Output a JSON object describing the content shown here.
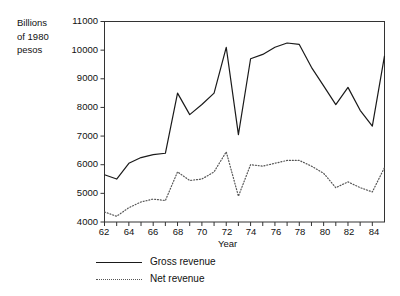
{
  "axis": {
    "y_title": "Billions\nof 1980\npesos",
    "x_title": "Year",
    "y_ticks": [
      "11000",
      "10000",
      "9000",
      "8000",
      "7000",
      "6000",
      "5000",
      "4000"
    ],
    "x_ticks": [
      "62",
      "64",
      "66",
      "68",
      "70",
      "72",
      "74",
      "76",
      "78",
      "80",
      "82",
      "84"
    ]
  },
  "legend": {
    "items": [
      {
        "label": "Gross revenue",
        "style": "solid",
        "color": "#1a1a1a"
      },
      {
        "label": "Net revenue",
        "style": "dotted",
        "color": "#555555"
      }
    ]
  },
  "chart_data": {
    "type": "line",
    "title": "",
    "xlabel": "Year",
    "ylabel": "Billions of 1980 pesos",
    "xlim": [
      62,
      85
    ],
    "ylim": [
      4000,
      11000
    ],
    "grid": false,
    "legend_position": "below-left",
    "x": [
      62,
      63,
      64,
      65,
      66,
      67,
      68,
      69,
      70,
      71,
      72,
      73,
      74,
      75,
      76,
      77,
      78,
      79,
      80,
      81,
      82,
      83,
      84,
      85
    ],
    "series": [
      {
        "name": "Gross revenue",
        "style": "solid",
        "color": "#1a1a1a",
        "values": [
          5650,
          5500,
          6050,
          6250,
          6350,
          6400,
          8500,
          7750,
          8100,
          8500,
          10100,
          7050,
          9700,
          9850,
          10100,
          10250,
          10200,
          9400,
          8750,
          8100,
          8700,
          7900,
          7350,
          9800
        ]
      },
      {
        "name": "Net revenue",
        "style": "dotted",
        "color": "#555555",
        "values": [
          4350,
          4200,
          4500,
          4700,
          4800,
          4750,
          5750,
          5450,
          5500,
          5750,
          6450,
          4900,
          6000,
          5950,
          6050,
          6150,
          6150,
          5950,
          5700,
          5200,
          5400,
          5200,
          5050,
          5900
        ]
      }
    ]
  }
}
